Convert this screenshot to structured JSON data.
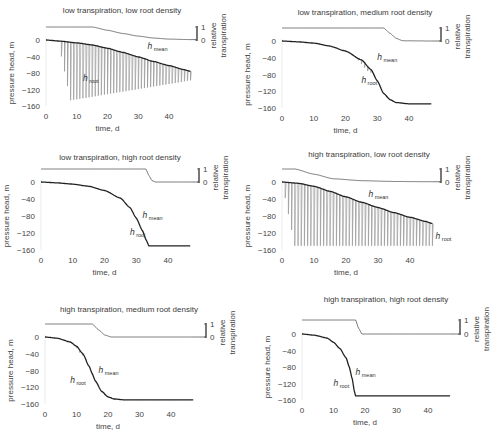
{
  "figure": {
    "xlabel": "time, d",
    "ylabel": "pressure head, m",
    "right_label_line1": "relative",
    "right_label_line2": "transpiration",
    "colors": {
      "mean": "#222222",
      "root": "#9a9a9a",
      "transp": "#555555"
    }
  },
  "chart_data": [
    {
      "type": "line",
      "title": "low transpiration, low root density",
      "xlabel": "time, d",
      "ylabel": "pressure head, m",
      "xlim": [
        0,
        47
      ],
      "ylim": [
        -160,
        0
      ],
      "xticks": [
        0,
        10,
        20,
        30,
        40
      ],
      "yticks": [
        0,
        -40,
        -80,
        -120,
        -160
      ],
      "right_axis": {
        "label": "relative transpiration",
        "ticks": [
          0,
          1
        ]
      },
      "series": [
        {
          "name": "h_mean",
          "x": [
            0,
            5,
            10,
            15,
            20,
            25,
            30,
            35,
            40,
            45,
            47
          ],
          "values": [
            0,
            -3,
            -7,
            -12,
            -20,
            -30,
            -41,
            -52,
            -62,
            -72,
            -76
          ]
        },
        {
          "name": "h_root",
          "style": "daily spikes",
          "onset_day": 5,
          "spike_min_first": -150,
          "spike_min_last": -98,
          "description": "daily oscillation reaching ~-150 from day 13, shallower later"
        },
        {
          "name": "relative transpiration",
          "x": [
            0,
            15,
            20,
            25,
            30,
            35,
            40,
            47
          ],
          "values": [
            1,
            1,
            0.75,
            0.5,
            0.3,
            0.15,
            0.07,
            0.03
          ]
        }
      ],
      "annotations": [
        {
          "text": "h_mean",
          "x": 33,
          "y": -22
        },
        {
          "text": "h_root",
          "x": 12,
          "y": -100
        }
      ]
    },
    {
      "type": "line",
      "title": "low transpiration, medium root density",
      "xlabel": "time, d",
      "ylabel": "pressure head, m",
      "xlim": [
        0,
        47
      ],
      "ylim": [
        -160,
        0
      ],
      "xticks": [
        0,
        10,
        20,
        30,
        40
      ],
      "yticks": [
        0,
        -40,
        -80,
        -120,
        -160
      ],
      "right_axis": {
        "label": "relative transpiration",
        "ticks": [
          0,
          1
        ]
      },
      "series": [
        {
          "name": "h_mean",
          "x": [
            0,
            5,
            10,
            15,
            20,
            25,
            28,
            30,
            32,
            34,
            36,
            40,
            47
          ],
          "values": [
            0,
            -2,
            -5,
            -12,
            -24,
            -45,
            -68,
            -95,
            -125,
            -140,
            -147,
            -150,
            -150
          ]
        },
        {
          "name": "h_root",
          "style": "daily spikes",
          "onset_day": 24,
          "spike_min_first": -60,
          "spike_min_last": -150,
          "description": "spikes between day 24 and 40"
        },
        {
          "name": "relative transpiration",
          "x": [
            0,
            32,
            34,
            36,
            38,
            47
          ],
          "values": [
            1,
            1,
            0.6,
            0.2,
            0.02,
            0
          ]
        }
      ],
      "annotations": [
        {
          "text": "h_mean",
          "x": 30,
          "y": -45
        },
        {
          "text": "h_root",
          "x": 25,
          "y": -100
        }
      ]
    },
    {
      "type": "line",
      "title": "low transpiration, high root density",
      "xlabel": "time, d",
      "ylabel": "pressure head, m",
      "xlim": [
        0,
        47
      ],
      "ylim": [
        -160,
        0
      ],
      "xticks": [
        0,
        10,
        20,
        30,
        40
      ],
      "yticks": [
        0,
        -40,
        -80,
        -120,
        -160
      ],
      "right_axis": {
        "label": "relative transpiration",
        "ticks": [
          0,
          1
        ]
      },
      "series": [
        {
          "name": "h_mean",
          "x": [
            0,
            5,
            10,
            15,
            20,
            25,
            28,
            30,
            32,
            33,
            34,
            40,
            47
          ],
          "values": [
            0,
            -2,
            -5,
            -10,
            -20,
            -38,
            -60,
            -85,
            -115,
            -135,
            -150,
            -150,
            -150
          ]
        },
        {
          "name": "h_root",
          "style": "overlapping h_mean",
          "description": "nearly identical to h_mean"
        },
        {
          "name": "relative transpiration",
          "x": [
            0,
            33,
            34,
            35,
            36,
            47
          ],
          "values": [
            1,
            1,
            0.5,
            0.1,
            0,
            0
          ]
        }
      ],
      "annotations": [
        {
          "text": "h_mean",
          "x": 32,
          "y": -85
        },
        {
          "text": "h_root",
          "x": 28,
          "y": -125
        }
      ]
    },
    {
      "type": "line",
      "title": "high transpiration, low root density",
      "xlabel": "time, d",
      "ylabel": "pressure head, m",
      "xlim": [
        0,
        47
      ],
      "ylim": [
        -160,
        0
      ],
      "xticks": [
        0,
        10,
        20,
        30,
        40
      ],
      "yticks": [
        0,
        -40,
        -80,
        -120,
        -160
      ],
      "right_axis": {
        "label": "relative transpiration",
        "ticks": [
          0,
          1
        ]
      },
      "series": [
        {
          "name": "h_mean",
          "x": [
            0,
            5,
            10,
            15,
            20,
            25,
            30,
            35,
            40,
            45,
            47
          ],
          "values": [
            0,
            -3,
            -10,
            -22,
            -35,
            -48,
            -60,
            -72,
            -83,
            -93,
            -98
          ]
        },
        {
          "name": "h_root",
          "style": "daily spikes",
          "onset_day": 1,
          "spike_min_first": -150,
          "spike_min_last": -150,
          "description": "daily oscillation to ~-150 from day 3"
        },
        {
          "name": "relative transpiration",
          "x": [
            0,
            4,
            10,
            16,
            25,
            35,
            47
          ],
          "values": [
            1,
            1,
            0.6,
            0.25,
            0.1,
            0.04,
            0.02
          ]
        }
      ],
      "annotations": [
        {
          "text": "h_mean",
          "x": 27,
          "y": -35
        },
        {
          "text": "h_root",
          "x": 48,
          "y": -135
        }
      ]
    },
    {
      "type": "line",
      "title": "high transpiration, medium root density",
      "xlabel": "time, d",
      "ylabel": "pressure head, m",
      "xlim": [
        0,
        47
      ],
      "ylim": [
        -160,
        0
      ],
      "xticks": [
        0,
        10,
        20,
        30,
        40
      ],
      "yticks": [
        0,
        -40,
        -80,
        -120,
        -160
      ],
      "right_axis": {
        "label": "relative transpiration",
        "ticks": [
          0,
          1
        ]
      },
      "series": [
        {
          "name": "h_mean",
          "x": [
            0,
            4,
            8,
            10,
            12,
            14,
            15,
            16,
            18,
            20,
            22,
            25,
            30,
            47
          ],
          "values": [
            0,
            -3,
            -12,
            -22,
            -40,
            -70,
            -88,
            -105,
            -130,
            -143,
            -148,
            -150,
            -150,
            -150
          ]
        },
        {
          "name": "h_root",
          "style": "daily spikes",
          "onset_day": 10,
          "spike_min_first": -40,
          "spike_min_last": -150,
          "description": "spikes between day 10 and 24"
        },
        {
          "name": "relative transpiration",
          "x": [
            0,
            15,
            17,
            19,
            21,
            47
          ],
          "values": [
            1,
            1,
            0.55,
            0.15,
            0,
            0
          ]
        }
      ],
      "annotations": [
        {
          "text": "h_mean",
          "x": 17,
          "y": -85
        },
        {
          "text": "h_root",
          "x": 8,
          "y": -110
        }
      ]
    },
    {
      "type": "line",
      "title": "high transpiration, high root density",
      "xlabel": "time, d",
      "ylabel": "pressure head, m",
      "xlim": [
        0,
        47
      ],
      "ylim": [
        -160,
        0
      ],
      "xticks": [
        0,
        10,
        20,
        30,
        40
      ],
      "yticks": [
        0,
        -40,
        -80,
        -120,
        -160
      ],
      "right_axis": {
        "label": "relative transpiration",
        "ticks": [
          0,
          1
        ]
      },
      "series": [
        {
          "name": "h_mean",
          "x": [
            0,
            4,
            8,
            10,
            12,
            14,
            15,
            16,
            16.5,
            17,
            20,
            47
          ],
          "values": [
            0,
            -3,
            -10,
            -20,
            -35,
            -58,
            -80,
            -110,
            -135,
            -150,
            -150,
            -150
          ]
        },
        {
          "name": "h_root",
          "style": "overlapping h_mean",
          "description": "nearly identical to h_mean"
        },
        {
          "name": "relative transpiration",
          "x": [
            0,
            17,
            18,
            19,
            47
          ],
          "values": [
            1,
            1,
            0.4,
            0,
            0
          ]
        }
      ],
      "annotations": [
        {
          "text": "h_mean",
          "x": 17,
          "y": -100
        },
        {
          "text": "h_root",
          "x": 10,
          "y": -125
        }
      ]
    }
  ],
  "layout": [
    {
      "ox": 46,
      "oy": 40,
      "x40": 169,
      "y160": 106,
      "titleX": 122,
      "titleY": 13,
      "rightAxisX": 197,
      "transTop": 27
    },
    {
      "ox": 282,
      "oy": 41,
      "x40": 409,
      "y160": 108,
      "titleX": 365,
      "titleY": 15,
      "rightAxisX": 441,
      "transTop": 28
    },
    {
      "ox": 41,
      "oy": 182,
      "x40": 168,
      "y160": 250,
      "titleX": 120,
      "titleY": 160,
      "rightAxisX": 199,
      "transTop": 169
    },
    {
      "ox": 282,
      "oy": 182,
      "x40": 410,
      "y160": 250,
      "titleX": 369,
      "titleY": 157,
      "rightAxisX": 441,
      "transTop": 169
    },
    {
      "ox": 45,
      "oy": 337,
      "x40": 171,
      "y160": 404,
      "titleX": 129,
      "titleY": 312,
      "rightAxisX": 206,
      "transTop": 324
    },
    {
      "ox": 302,
      "oy": 334,
      "x40": 428,
      "y160": 400,
      "titleX": 386,
      "titleY": 302,
      "rightAxisX": 460,
      "transTop": 320
    }
  ]
}
